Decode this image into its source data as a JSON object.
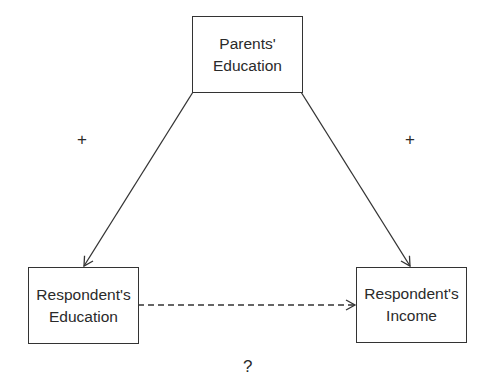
{
  "diagram": {
    "nodes": [
      {
        "id": "parents_education",
        "line1": "Parents'",
        "line2": "Education"
      },
      {
        "id": "respondent_education",
        "line1": "Respondent's",
        "line2": "Education"
      },
      {
        "id": "respondent_income",
        "line1": "Respondent's",
        "line2": "Income"
      }
    ],
    "edges": [
      {
        "from": "parents_education",
        "to": "respondent_education",
        "style": "solid",
        "sign": "+"
      },
      {
        "from": "parents_education",
        "to": "respondent_income",
        "style": "solid",
        "sign": "+"
      },
      {
        "from": "respondent_education",
        "to": "respondent_income",
        "style": "dashed",
        "sign": "?"
      }
    ],
    "labels": {
      "left_sign": "+",
      "right_sign": "+",
      "bottom_sign": "?"
    },
    "colors": {
      "line": "#333333",
      "text": "#2a2a2a",
      "background": "#ffffff"
    }
  }
}
